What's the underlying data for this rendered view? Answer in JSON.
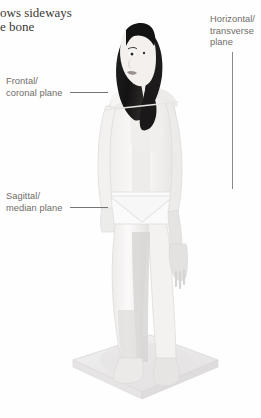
{
  "page": {
    "width": 261,
    "height": 418,
    "background": "#fefefe"
  },
  "body_copy": {
    "line_clipped": "",
    "line_1": "ows sideways",
    "line_2": "e bone"
  },
  "labels": {
    "horizontal": {
      "line_1": "Horizontal/",
      "line_2": "transverse",
      "line_3": "plane"
    },
    "frontal": {
      "line_1": "Frontal/",
      "line_2": "coronal plane"
    },
    "sagittal": {
      "line_1": "Sagittal/",
      "line_2": "median plane"
    }
  },
  "figure": {
    "skin": "#f2f0ee",
    "skin_shadow": "#e2e0de",
    "hair": "#191818",
    "plane_shade": "#d9d8d6",
    "platform": "#eceaea",
    "platform_edge": "#dcd9d9",
    "outline": "#d6d4d2"
  },
  "colors": {
    "text_serif": "#3a3733",
    "text_label": "#6f6c68",
    "leader": "#8d8a86"
  }
}
